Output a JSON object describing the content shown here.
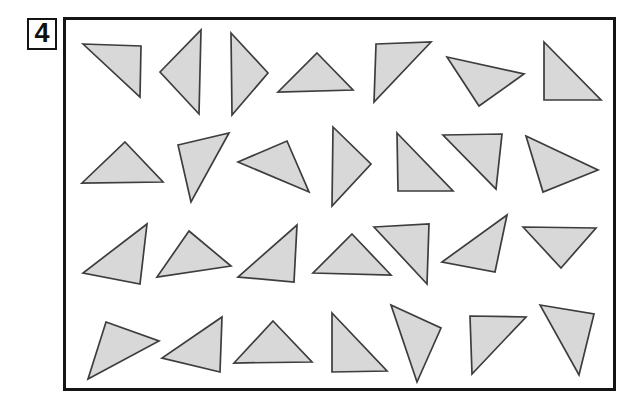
{
  "figure": {
    "item_number": "4",
    "triangle_count": 28,
    "colors": {
      "triangle_fill": "#d8d8d8",
      "triangle_stroke": "#3d3d3d",
      "frame_border": "#151515",
      "background": "#ffffff"
    },
    "triangles": [
      {
        "points": [
          [
            83,
            44
          ],
          [
            141,
            46
          ],
          [
            140,
            97
          ]
        ]
      },
      {
        "points": [
          [
            160,
            72
          ],
          [
            201,
            30
          ],
          [
            199,
            114
          ]
        ]
      },
      {
        "points": [
          [
            231,
            33
          ],
          [
            268,
            73
          ],
          [
            232,
            115
          ]
        ]
      },
      {
        "points": [
          [
            317,
            53
          ],
          [
            353,
            90
          ],
          [
            278,
            92
          ]
        ]
      },
      {
        "points": [
          [
            376,
            44
          ],
          [
            431,
            42
          ],
          [
            374,
            102
          ]
        ]
      },
      {
        "points": [
          [
            447,
            57
          ],
          [
            524,
            74
          ],
          [
            479,
            106
          ]
        ]
      },
      {
        "points": [
          [
            544,
            42
          ],
          [
            601,
            100
          ],
          [
            544,
            100
          ]
        ]
      },
      {
        "points": [
          [
            125,
            142
          ],
          [
            163,
            182
          ],
          [
            82,
            183
          ]
        ]
      },
      {
        "points": [
          [
            178,
            145
          ],
          [
            229,
            133
          ],
          [
            191,
            202
          ]
        ]
      },
      {
        "points": [
          [
            287,
            141
          ],
          [
            309,
            192
          ],
          [
            238,
            162
          ]
        ]
      },
      {
        "points": [
          [
            333,
            127
          ],
          [
            371,
            164
          ],
          [
            332,
            206
          ]
        ]
      },
      {
        "points": [
          [
            397,
            133
          ],
          [
            453,
            191
          ],
          [
            398,
            191
          ]
        ]
      },
      {
        "points": [
          [
            443,
            135
          ],
          [
            502,
            134
          ],
          [
            496,
            189
          ]
        ]
      },
      {
        "points": [
          [
            526,
            136
          ],
          [
            598,
            170
          ],
          [
            543,
            192
          ]
        ]
      },
      {
        "points": [
          [
            147,
            224
          ],
          [
            140,
            284
          ],
          [
            83,
            273
          ]
        ]
      },
      {
        "points": [
          [
            189,
            231
          ],
          [
            231,
            266
          ],
          [
            157,
            277
          ]
        ]
      },
      {
        "points": [
          [
            297,
            225
          ],
          [
            294,
            282
          ],
          [
            238,
            277
          ]
        ]
      },
      {
        "points": [
          [
            352,
            234
          ],
          [
            391,
            275
          ],
          [
            313,
            273
          ]
        ]
      },
      {
        "points": [
          [
            374,
            227
          ],
          [
            429,
            224
          ],
          [
            427,
            284
          ]
        ]
      },
      {
        "points": [
          [
            507,
            215
          ],
          [
            495,
            272
          ],
          [
            442,
            262
          ]
        ]
      },
      {
        "points": [
          [
            523,
            227
          ],
          [
            596,
            228
          ],
          [
            561,
            268
          ]
        ]
      },
      {
        "points": [
          [
            106,
            322
          ],
          [
            159,
            341
          ],
          [
            88,
            379
          ]
        ]
      },
      {
        "points": [
          [
            222,
            317
          ],
          [
            220,
            372
          ],
          [
            162,
            358
          ]
        ]
      },
      {
        "points": [
          [
            273,
            321
          ],
          [
            312,
            362
          ],
          [
            234,
            363
          ]
        ]
      },
      {
        "points": [
          [
            332,
            313
          ],
          [
            387,
            371
          ],
          [
            332,
            372
          ]
        ]
      },
      {
        "points": [
          [
            391,
            305
          ],
          [
            441,
            328
          ],
          [
            417,
            382
          ]
        ]
      },
      {
        "points": [
          [
            470,
            316
          ],
          [
            526,
            317
          ],
          [
            472,
            374
          ]
        ]
      },
      {
        "points": [
          [
            540,
            305
          ],
          [
            594,
            314
          ],
          [
            579,
            375
          ]
        ]
      }
    ]
  }
}
